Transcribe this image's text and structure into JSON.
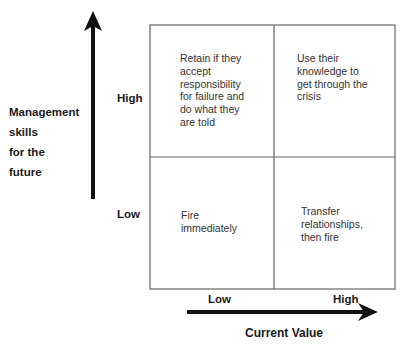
{
  "y_axis": {
    "label_lines": [
      "Management",
      "skills",
      "for the",
      "future"
    ],
    "ticks": {
      "high": "High",
      "low": "Low"
    }
  },
  "x_axis": {
    "label": "Current Value",
    "ticks": {
      "low": "Low",
      "high": "High"
    }
  },
  "quadrants": {
    "top_left": [
      "Retain if they",
      "accept",
      "responsibility",
      "for failure and",
      "do what they",
      "are told"
    ],
    "top_right": [
      "Use their",
      "knowledge to",
      "get through the",
      "crisis"
    ],
    "bottom_left": [
      "Fire",
      "immediately"
    ],
    "bottom_right": [
      "Transfer",
      "relationships,",
      "then fire"
    ]
  },
  "colors": {
    "grid_line": "#666666",
    "arrow": "#111111",
    "text": "#333333"
  }
}
